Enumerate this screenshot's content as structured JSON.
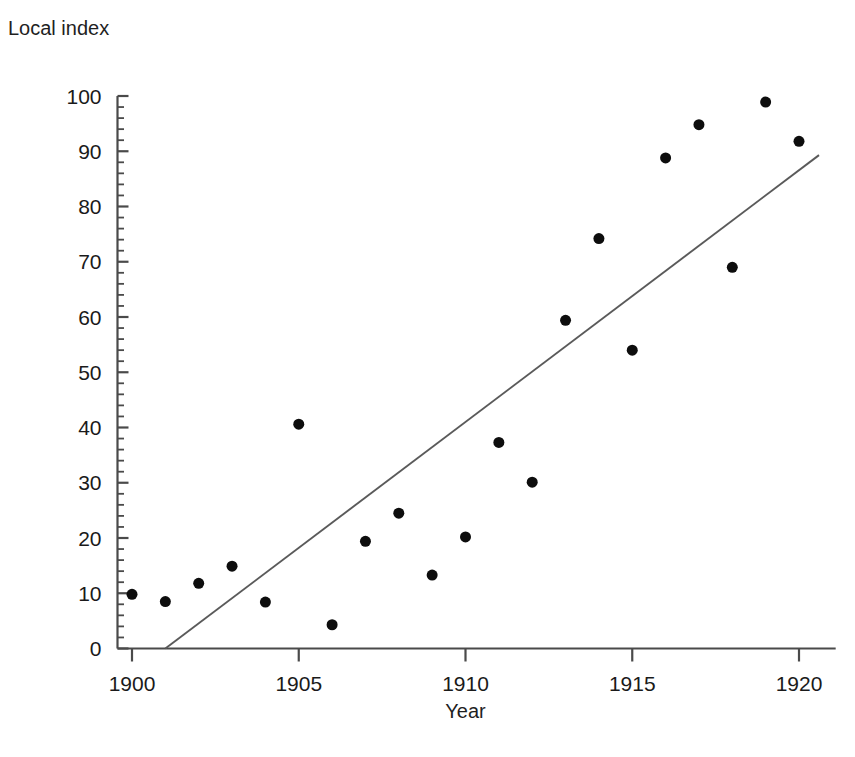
{
  "chart_data": {
    "type": "scatter",
    "title": "",
    "xlabel": "Year",
    "ylabel": "Local index",
    "xlim": [
      1899.55,
      1921.1
    ],
    "ylim": [
      0,
      100
    ],
    "xticks": [
      1900,
      1905,
      1910,
      1915,
      1920
    ],
    "xtick_labels": [
      "1900",
      "1905",
      "1910",
      "1915",
      "1920"
    ],
    "yticks": [
      0,
      10,
      20,
      30,
      40,
      50,
      60,
      70,
      80,
      90,
      100
    ],
    "ytick_labels": [
      "0",
      "10",
      "20",
      "30",
      "40",
      "50",
      "60",
      "70",
      "80",
      "90",
      "100"
    ],
    "y_minor_tick_step": 2,
    "grid": false,
    "legend": null,
    "marker": "filled-circle",
    "marker_color": "#0d0d0d",
    "marker_size_px": 11,
    "line_color": "#5a5a5a",
    "axis_color": "#4a4a4a",
    "x": [
      1900,
      1901,
      1902,
      1903,
      1904,
      1905,
      1906,
      1907,
      1908,
      1909,
      1910,
      1911,
      1912,
      1913,
      1914,
      1915,
      1916,
      1917,
      1918,
      1919,
      1920
    ],
    "y": [
      9.8,
      8.5,
      11.8,
      14.9,
      8.4,
      40.6,
      4.3,
      19.4,
      24.5,
      13.3,
      20.2,
      37.3,
      30.1,
      59.4,
      74.2,
      54.0,
      88.8,
      94.8,
      69.0,
      98.9,
      91.8
    ],
    "points": [
      {
        "year": 1900,
        "value": 9.8
      },
      {
        "year": 1901,
        "value": 8.5
      },
      {
        "year": 1902,
        "value": 11.8
      },
      {
        "year": 1903,
        "value": 14.9
      },
      {
        "year": 1904,
        "value": 8.4
      },
      {
        "year": 1905,
        "value": 40.6
      },
      {
        "year": 1906,
        "value": 4.3
      },
      {
        "year": 1907,
        "value": 19.4
      },
      {
        "year": 1908,
        "value": 24.5
      },
      {
        "year": 1909,
        "value": 13.3
      },
      {
        "year": 1910,
        "value": 20.2
      },
      {
        "year": 1911,
        "value": 37.3
      },
      {
        "year": 1912,
        "value": 30.1
      },
      {
        "year": 1913,
        "value": 59.4
      },
      {
        "year": 1914,
        "value": 74.2
      },
      {
        "year": 1915,
        "value": 54.0
      },
      {
        "year": 1916,
        "value": 88.8
      },
      {
        "year": 1917,
        "value": 94.8
      },
      {
        "year": 1918,
        "value": 69.0
      },
      {
        "year": 1919,
        "value": 98.9
      },
      {
        "year": 1920,
        "value": 91.8
      }
    ],
    "fit_line": {
      "name": "regression-line",
      "x_start": 1901.0,
      "y_start": 0.0,
      "x_end": 1920.6,
      "y_end": 89.3
    }
  }
}
